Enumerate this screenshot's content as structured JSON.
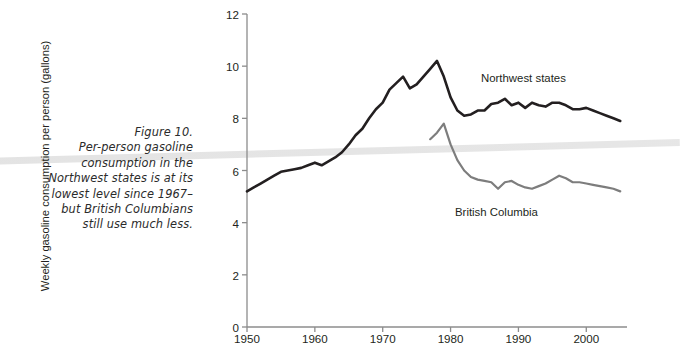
{
  "caption": {
    "lines": [
      "Figure 10.",
      "Per-person gasoline",
      "consumption in the",
      "Northwest states is at its",
      "lowest level since 1967–",
      "but British Columbians",
      "still use much less."
    ]
  },
  "colors": {
    "northwest": "#231f20",
    "british_columbia": "#7d7d7d",
    "axis": "#8c8c8c",
    "text": "#231f20"
  },
  "chart_data": {
    "type": "line",
    "title": "",
    "xlabel": "",
    "ylabel": "Weekly gasoline consumption per person (gallons)",
    "xlim": [
      1950,
      2006
    ],
    "ylim": [
      0,
      12
    ],
    "yticks": [
      0,
      2,
      4,
      6,
      8,
      10,
      12
    ],
    "ytick_labels": [
      "0",
      "2",
      "4",
      "6",
      "8",
      "10",
      "12"
    ],
    "xticks": [
      1950,
      1960,
      1970,
      1980,
      1990,
      2000
    ],
    "xtick_labels": [
      "1950",
      "1960",
      "1970",
      "1980",
      "1990",
      "2000"
    ],
    "grid": false,
    "legend": "inline-annotations",
    "series": [
      {
        "name": "Northwest states",
        "color": "#231f20",
        "x": [
          1950,
          1951,
          1952,
          1953,
          1954,
          1955,
          1956,
          1957,
          1958,
          1959,
          1960,
          1961,
          1962,
          1963,
          1964,
          1965,
          1966,
          1967,
          1968,
          1969,
          1970,
          1971,
          1972,
          1973,
          1974,
          1975,
          1976,
          1977,
          1978,
          1979,
          1980,
          1981,
          1982,
          1983,
          1984,
          1985,
          1986,
          1987,
          1988,
          1989,
          1990,
          1991,
          1992,
          1993,
          1994,
          1995,
          1996,
          1997,
          1998,
          1999,
          2000,
          2001,
          2002,
          2003,
          2004,
          2005
        ],
        "y": [
          5.2,
          5.35,
          5.5,
          5.65,
          5.8,
          5.95,
          6.0,
          6.05,
          6.1,
          6.2,
          6.3,
          6.2,
          6.35,
          6.5,
          6.7,
          7.0,
          7.35,
          7.6,
          8.0,
          8.35,
          8.6,
          9.1,
          9.35,
          9.6,
          9.15,
          9.3,
          9.6,
          9.9,
          10.2,
          9.6,
          8.8,
          8.3,
          8.1,
          8.15,
          8.3,
          8.3,
          8.55,
          8.6,
          8.75,
          8.5,
          8.6,
          8.4,
          8.6,
          8.5,
          8.45,
          8.6,
          8.6,
          8.5,
          8.35,
          8.35,
          8.4,
          8.3,
          8.2,
          8.1,
          8.0,
          7.9
        ]
      },
      {
        "name": "British Columbia",
        "color": "#7d7d7d",
        "x": [
          1977,
          1978,
          1979,
          1980,
          1981,
          1982,
          1983,
          1984,
          1985,
          1986,
          1987,
          1988,
          1989,
          1990,
          1991,
          1992,
          1993,
          1994,
          1995,
          1996,
          1997,
          1998,
          1999,
          2000,
          2001,
          2002,
          2003,
          2004,
          2005
        ],
        "y": [
          7.2,
          7.45,
          7.8,
          7.0,
          6.4,
          6.0,
          5.75,
          5.65,
          5.6,
          5.55,
          5.3,
          5.55,
          5.6,
          5.45,
          5.35,
          5.3,
          5.4,
          5.5,
          5.65,
          5.8,
          5.7,
          5.55,
          5.55,
          5.5,
          5.45,
          5.4,
          5.35,
          5.3,
          5.2
        ]
      }
    ]
  }
}
